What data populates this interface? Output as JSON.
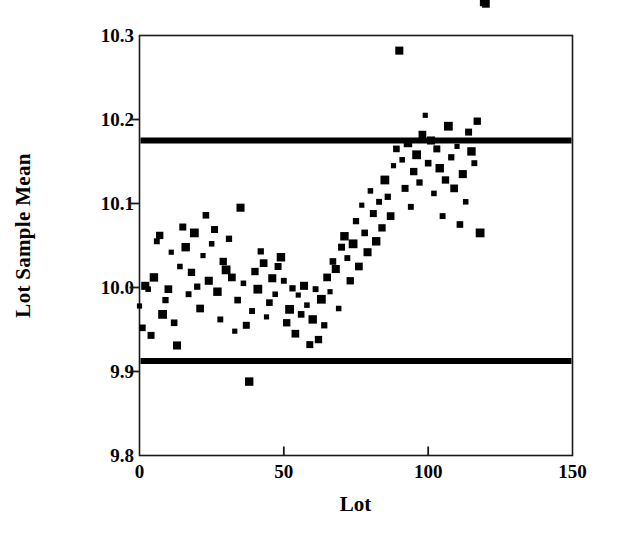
{
  "chart_data": {
    "type": "scatter",
    "title": "",
    "xlabel": "Lot",
    "ylabel": "Lot Sample Mean",
    "xlim": [
      0,
      150
    ],
    "ylim": [
      9.8,
      10.3
    ],
    "xticks": [
      0,
      50,
      100,
      150
    ],
    "xtick_labels": [
      "0",
      "50",
      "100",
      "150"
    ],
    "yticks": [
      9.8,
      9.9,
      10.0,
      10.1,
      10.2,
      10.3
    ],
    "ytick_labels": [
      "9.8",
      "9.9",
      "10.0",
      "10.1",
      "10.2",
      "10.3"
    ],
    "grid": false,
    "legend": null,
    "marker": "square",
    "marker_color": "#000000",
    "frame_color": "#1a1a1a",
    "reference_lines": [
      {
        "name": "upper-control-limit",
        "orientation": "horizontal",
        "value": 10.175,
        "color": "#000000",
        "width_px": 6
      },
      {
        "name": "lower-control-limit",
        "orientation": "horizontal",
        "value": 9.9125,
        "color": "#000000",
        "width_px": 6
      }
    ],
    "x": [
      0,
      1,
      2,
      3,
      4,
      5,
      6,
      7,
      8,
      9,
      10,
      11,
      12,
      13,
      14,
      15,
      16,
      17,
      18,
      19,
      20,
      21,
      22,
      23,
      24,
      25,
      26,
      27,
      28,
      29,
      30,
      31,
      32,
      33,
      34,
      35,
      36,
      37,
      38,
      39,
      40,
      41,
      42,
      43,
      44,
      45,
      46,
      47,
      48,
      49,
      50,
      51,
      52,
      53,
      54,
      55,
      56,
      57,
      58,
      59,
      60,
      61,
      62,
      63,
      64,
      65,
      66,
      67,
      68,
      69,
      70,
      71,
      72,
      73,
      74,
      75,
      76,
      77,
      78,
      79,
      80,
      81,
      82,
      83,
      84,
      85,
      86,
      87,
      88,
      89,
      90,
      91,
      92,
      93,
      94,
      95,
      96,
      97,
      98,
      99,
      100,
      101,
      102,
      103,
      104,
      105,
      106,
      107,
      108,
      109,
      110,
      111,
      112,
      113,
      114,
      115,
      116,
      117,
      118,
      119,
      120
    ],
    "y": [
      9.978,
      9.952,
      10.002,
      9.998,
      9.943,
      10.012,
      10.055,
      10.062,
      9.968,
      9.985,
      9.998,
      10.042,
      9.958,
      9.931,
      10.025,
      10.072,
      10.048,
      9.992,
      10.018,
      10.065,
      10.001,
      9.975,
      10.038,
      10.086,
      10.008,
      10.052,
      10.069,
      9.995,
      9.962,
      10.031,
      10.021,
      10.058,
      10.012,
      9.948,
      9.985,
      10.095,
      10.005,
      9.955,
      9.888,
      9.972,
      10.019,
      9.998,
      10.043,
      10.029,
      9.965,
      9.982,
      10.011,
      9.992,
      10.025,
      10.036,
      10.008,
      9.958,
      9.974,
      9.999,
      9.945,
      9.991,
      9.968,
      10.002,
      9.979,
      9.932,
      9.962,
      9.998,
      9.938,
      9.986,
      9.955,
      10.012,
      9.995,
      10.031,
      10.022,
      9.975,
      10.048,
      10.061,
      10.035,
      10.008,
      10.052,
      10.079,
      10.025,
      10.098,
      10.065,
      10.042,
      10.115,
      10.088,
      10.055,
      10.102,
      10.071,
      10.128,
      10.108,
      10.085,
      10.145,
      10.165,
      10.282,
      10.152,
      10.118,
      10.172,
      10.096,
      10.138,
      10.158,
      10.125,
      10.182,
      10.205,
      10.148,
      10.175,
      10.112,
      10.165,
      10.142,
      10.085,
      10.128,
      10.192,
      10.155,
      10.118,
      10.168,
      10.075,
      10.135,
      10.102,
      10.185,
      10.162,
      10.148,
      10.198,
      10.065
    ]
  }
}
